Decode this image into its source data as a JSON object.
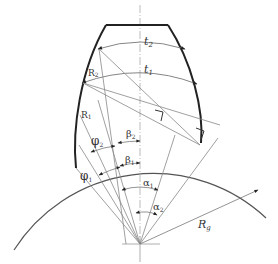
{
  "diagram": {
    "title": "",
    "labels": {
      "t2": "t",
      "t2_sub": "2",
      "t1": "t",
      "t1_sub": "1",
      "R2": "R",
      "R2_sub": "2",
      "R1": "R",
      "R1_sub": "1",
      "phi2": "φ",
      "phi2_sub": "2",
      "phi1": "φ",
      "phi1_sub": "1",
      "beta2": "β",
      "beta2_sub": "2",
      "beta1": "β",
      "beta1_sub": "1",
      "alpha1": "α",
      "alpha1_sub": "1",
      "alpha2": "α",
      "alpha2_sub": "2",
      "Rg": "R",
      "Rg_sub": "g"
    },
    "colors": {
      "outline": "#2b2b2b",
      "thin_line": "#8a8a8a",
      "text": "#333333"
    }
  }
}
